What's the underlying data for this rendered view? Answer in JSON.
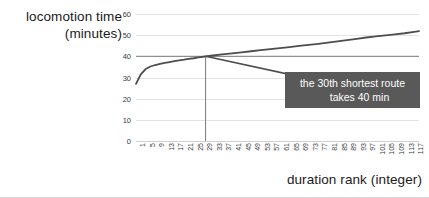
{
  "chart_data": {
    "type": "line",
    "title": "",
    "xlabel": "duration rank (integer)",
    "ylabel_line1": "locomotion time",
    "ylabel_line2": "(minutes)",
    "xlim": [
      1,
      119
    ],
    "ylim": [
      0,
      60
    ],
    "yticks": [
      0,
      10,
      20,
      30,
      40,
      50,
      60
    ],
    "xticks": [
      1,
      5,
      9,
      13,
      17,
      21,
      25,
      29,
      33,
      37,
      41,
      45,
      49,
      53,
      57,
      61,
      65,
      69,
      73,
      77,
      81,
      85,
      89,
      93,
      97,
      101,
      105,
      109,
      113,
      117
    ],
    "grid": true,
    "legend": "none",
    "line_color": "#4d4d4d",
    "grid_color": "#e3e3e3",
    "series": [
      {
        "name": "locomotion time",
        "x": [
          1,
          3,
          5,
          7,
          9,
          11,
          13,
          15,
          17,
          19,
          21,
          23,
          25,
          27,
          29,
          30,
          33,
          37,
          41,
          45,
          49,
          53,
          57,
          61,
          65,
          69,
          73,
          77,
          81,
          85,
          89,
          93,
          97,
          101,
          105,
          109,
          113,
          117,
          119
        ],
        "values": [
          27.0,
          31.5,
          34.0,
          35.2,
          35.9,
          36.4,
          36.9,
          37.3,
          37.7,
          38.1,
          38.4,
          38.8,
          39.1,
          39.5,
          39.8,
          40.0,
          40.4,
          40.9,
          41.4,
          41.9,
          42.4,
          42.9,
          43.4,
          43.9,
          44.4,
          44.9,
          45.4,
          45.9,
          46.5,
          47.1,
          47.7,
          48.3,
          48.9,
          49.4,
          49.9,
          50.4,
          50.9,
          51.6,
          51.9
        ]
      }
    ],
    "reference_lines": [
      {
        "name": "horizontal-40-min",
        "orientation": "horizontal",
        "value": 40,
        "color": "#7a7a7a"
      },
      {
        "name": "vertical-rank-30",
        "orientation": "vertical",
        "value": 30,
        "color": "#7a7a7a"
      }
    ],
    "annotations": [
      {
        "name": "callout-30th-route",
        "line1": "the 30th shortest route",
        "line2": "takes 40 min",
        "box_color": "#595959",
        "text_color": "#ffffff",
        "leader_from": {
          "x": 30,
          "y": 40
        },
        "leader_to": {
          "x": 75,
          "y": 29
        }
      }
    ]
  }
}
